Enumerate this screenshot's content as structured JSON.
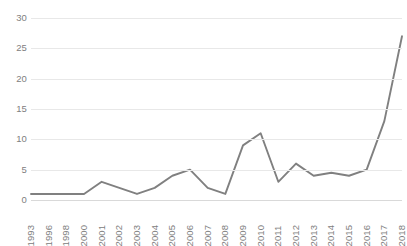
{
  "chart_data": {
    "type": "line",
    "title": "",
    "subtitle": "",
    "xlabel": "",
    "ylabel": "",
    "categories": [
      "1993",
      "1996",
      "1998",
      "2000",
      "2001",
      "2002",
      "2003",
      "2004",
      "2005",
      "2006",
      "2007",
      "2008",
      "2009",
      "2010",
      "2011",
      "2012",
      "2013",
      "2014",
      "2015",
      "2016",
      "2017",
      "2018"
    ],
    "values": [
      1,
      1,
      1,
      1,
      3,
      2,
      1,
      2,
      4,
      5,
      2,
      1,
      9,
      11,
      3,
      6,
      4,
      4.5,
      4,
      5,
      13,
      27
    ],
    "series": [
      {
        "name": "",
        "values": [
          1,
          1,
          1,
          1,
          3,
          2,
          1,
          2,
          4,
          5,
          2,
          1,
          9,
          11,
          3,
          6,
          4,
          4.5,
          4,
          5,
          13,
          27
        ]
      }
    ],
    "ylim": [
      0,
      30
    ],
    "yticks": [
      0,
      5,
      10,
      15,
      20,
      25,
      30
    ],
    "ytick_labels": [
      "0",
      "5",
      "10",
      "15",
      "20",
      "25",
      "30"
    ],
    "grid": true,
    "grid_axis": "y",
    "legend": false,
    "legend_position": "none",
    "line_color": "#808080",
    "gridline_color": "#e8e8e8",
    "axis_text_color": "#808080",
    "background_color": "#ffffff",
    "annotations": []
  }
}
